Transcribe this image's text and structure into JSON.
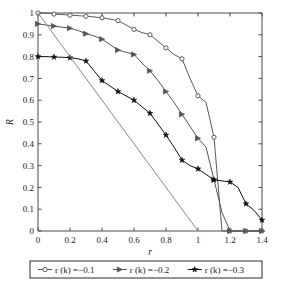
{
  "chart_data": {
    "type": "line",
    "title": "",
    "xlabel": "r",
    "ylabel": "R",
    "xlim": [
      0,
      1.4
    ],
    "ylim": [
      0,
      1
    ],
    "xticks": [
      "0",
      "0.2",
      "0.4",
      "0.6",
      "0.8",
      "1",
      "1.2",
      "1.4"
    ],
    "xtick_values": [
      0,
      0.2,
      0.4,
      0.6,
      0.8,
      1,
      1.2,
      1.4
    ],
    "yticks": [
      "0",
      "0.1",
      "0.2",
      "0.3",
      "0.4",
      "0.5",
      "0.6",
      "0.7",
      "0.8",
      "0.9",
      "1"
    ],
    "ytick_values": [
      0,
      0.1,
      0.2,
      0.3,
      0.4,
      0.5,
      0.6,
      0.7,
      0.8,
      0.9,
      1
    ],
    "grid": false,
    "legend_position": "below-axes",
    "series": [
      {
        "name": "r (k) =−0.1",
        "marker": "circle",
        "color": "#595959",
        "x": [
          0,
          0.05,
          0.1,
          0.15,
          0.2,
          0.25,
          0.3,
          0.35,
          0.4,
          0.45,
          0.5,
          0.55,
          0.6,
          0.65,
          0.7,
          0.75,
          0.8,
          0.85,
          0.9,
          0.95,
          1.0,
          1.05,
          1.1,
          1.15,
          1.2,
          1.25,
          1.3,
          1.35,
          1.4
        ],
        "values": [
          1.0,
          1.0,
          0.995,
          0.993,
          0.99,
          0.988,
          0.985,
          0.982,
          0.978,
          0.972,
          0.965,
          0.945,
          0.925,
          0.91,
          0.9,
          0.87,
          0.84,
          0.81,
          0.79,
          0.7,
          0.62,
          0.59,
          0.43,
          0.0,
          0.0,
          0.0,
          0.0,
          0.0,
          0.0
        ]
      },
      {
        "name": "r (k) =−0.2",
        "marker": "triangle",
        "color": "#555555",
        "x": [
          0,
          0.05,
          0.1,
          0.15,
          0.2,
          0.25,
          0.3,
          0.35,
          0.4,
          0.45,
          0.5,
          0.55,
          0.6,
          0.65,
          0.7,
          0.75,
          0.8,
          0.85,
          0.9,
          0.95,
          1.0,
          1.05,
          1.1,
          1.15,
          1.2,
          1.25,
          1.3,
          1.35,
          1.4
        ],
        "values": [
          0.95,
          0.945,
          0.94,
          0.935,
          0.93,
          0.92,
          0.905,
          0.895,
          0.88,
          0.855,
          0.83,
          0.82,
          0.81,
          0.77,
          0.735,
          0.69,
          0.64,
          0.59,
          0.535,
          0.48,
          0.425,
          0.385,
          0.235,
          0.085,
          0.0,
          0.0,
          0.0,
          0.0,
          0.0
        ]
      },
      {
        "name": "r (k) =−0.3",
        "marker": "star",
        "color": "#111111",
        "x": [
          0,
          0.05,
          0.1,
          0.15,
          0.2,
          0.25,
          0.3,
          0.35,
          0.4,
          0.45,
          0.5,
          0.55,
          0.6,
          0.65,
          0.7,
          0.75,
          0.8,
          0.85,
          0.9,
          0.95,
          1.0,
          1.05,
          1.1,
          1.15,
          1.2,
          1.25,
          1.3,
          1.35,
          1.4
        ],
        "values": [
          0.8,
          0.8,
          0.798,
          0.797,
          0.795,
          0.79,
          0.78,
          0.735,
          0.69,
          0.665,
          0.64,
          0.62,
          0.6,
          0.57,
          0.54,
          0.49,
          0.44,
          0.385,
          0.325,
          0.3,
          0.285,
          0.26,
          0.235,
          0.23,
          0.225,
          0.2,
          0.125,
          0.095,
          0.05
        ]
      },
      {
        "name": "reference-line",
        "marker": "none",
        "color": "#888888",
        "x": [
          0,
          1.0
        ],
        "values": [
          1.0,
          0.0
        ]
      }
    ],
    "legend": [
      {
        "label": "r (k) =−0.1",
        "marker": "circle",
        "color": "#595959"
      },
      {
        "label": "r (k) =−0.2",
        "marker": "triangle",
        "color": "#555555"
      },
      {
        "label": "r (k) =−0.3",
        "marker": "star",
        "color": "#111111"
      }
    ]
  }
}
